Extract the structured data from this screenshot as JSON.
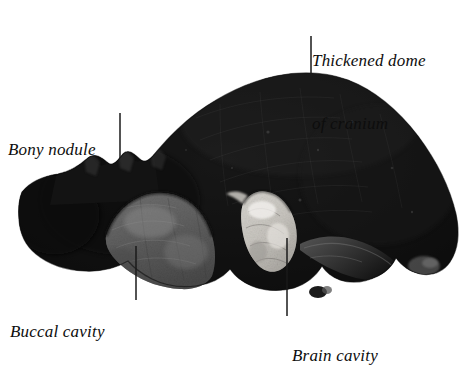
{
  "figure": {
    "kind": "anatomical-specimen-photograph",
    "background_color": "#ffffff",
    "specimen_colors": {
      "dome_dark": "#111111",
      "body_dark": "#1a1a1a",
      "buccal_gray": "#6f6f6f",
      "brain_light": "#d8d5d0",
      "edge_mid": "#4a4a4a"
    },
    "leader_line_color": "#1a1a1a"
  },
  "labels": [
    {
      "id": "thickened-dome",
      "line1": "Thickened dome",
      "line2": "of cranium",
      "leader": {
        "x1": 311,
        "y1": 36,
        "x2": 311,
        "y2": 86
      }
    },
    {
      "id": "bony-nodule",
      "line1": "Bony nodule",
      "line2": "",
      "leader": {
        "x1": 120,
        "y1": 113,
        "x2": 120,
        "y2": 158
      }
    },
    {
      "id": "buccal-cavity",
      "line1": "Buccal cavity",
      "line2": "",
      "leader": {
        "x1": 136,
        "y1": 246,
        "x2": 136,
        "y2": 300
      }
    },
    {
      "id": "brain-cavity",
      "line1": "Brain cavity",
      "line2": "",
      "leader": {
        "x1": 287,
        "y1": 238,
        "x2": 287,
        "y2": 316
      }
    }
  ]
}
